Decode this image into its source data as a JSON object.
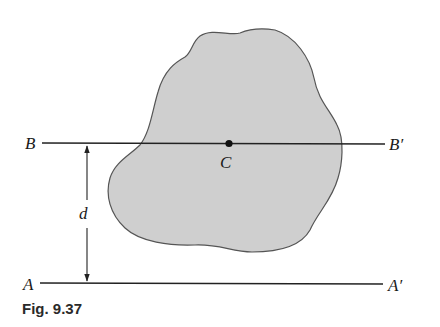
{
  "figure": {
    "caption": "Fig. 9.37",
    "labels": {
      "B": "B",
      "B_prime": "B′",
      "A": "A",
      "A_prime": "A′",
      "C": "C",
      "d": "d"
    },
    "colors": {
      "area_fill": "#cfcfcf",
      "outline": "#555555",
      "line": "#222222"
    }
  }
}
